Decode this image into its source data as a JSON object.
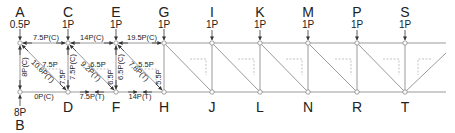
{
  "diagram": {
    "type": "truss",
    "top_nodes": [
      {
        "id": "A",
        "load": "0.5P",
        "x": 20
      },
      {
        "id": "C",
        "load": "1P",
        "x": 68
      },
      {
        "id": "E",
        "load": "1P",
        "x": 116
      },
      {
        "id": "G",
        "load": "1P",
        "x": 164
      },
      {
        "id": "I",
        "load": "1P",
        "x": 212
      },
      {
        "id": "K",
        "load": "1P",
        "x": 260
      },
      {
        "id": "M",
        "load": "1P",
        "x": 308
      },
      {
        "id": "P",
        "load": "1P",
        "x": 357
      },
      {
        "id": "S",
        "load": "1P",
        "x": 405
      }
    ],
    "bottom_nodes": [
      {
        "id": "B",
        "reaction": "8P",
        "x": 20
      },
      {
        "id": "D",
        "x": 68
      },
      {
        "id": "F",
        "x": 116
      },
      {
        "id": "H",
        "x": 164
      },
      {
        "id": "J",
        "x": 212
      },
      {
        "id": "L",
        "x": 260
      },
      {
        "id": "N",
        "x": 308
      },
      {
        "id": "R",
        "x": 357
      },
      {
        "id": "T",
        "x": 405
      }
    ],
    "member_forces": {
      "AC": "7.5P(C)",
      "CE": "14P(C)",
      "EG": "19.5P(C)",
      "AB": "8P(C)",
      "CD": "7.5P(C)",
      "EF": "6.5P(C)",
      "AD": "10.6P(T)",
      "CF": "9.2P(T)",
      "EH": "7.8P(T)",
      "BD": "0P(C)",
      "DF": "7.5P(T)",
      "FH": "14P(T)"
    },
    "components": {
      "AD": {
        "h": "7.5P",
        "v": "7.5P"
      },
      "CF": {
        "h": "6.5P",
        "v": "6.5P"
      },
      "EH": {
        "h": "5.5P",
        "v": "5.5P"
      }
    },
    "colors": {
      "line": "#9a9a9a",
      "text": "#222222",
      "dashed": "#aaaaaa"
    }
  }
}
